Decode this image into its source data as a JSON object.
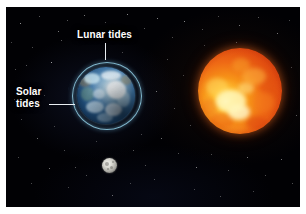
{
  "figure": {
    "background_color": "#010104",
    "frame_color": "#ffffff"
  },
  "labels": {
    "lunar_tides": "Lunar tides",
    "solar_tides": "Solar tides",
    "label_color": "#ffffff",
    "leader_color": "#e9eef2"
  },
  "bodies": {
    "earth": {
      "name": "Earth",
      "tidal_envelope_color": "#8ec8e4",
      "ocean_color": "#2f6ea0",
      "cloud_color": "#f2f6f8"
    },
    "sun": {
      "name": "Sun",
      "core_color": "#ffe066",
      "surface_color": "#ef6a15",
      "limb_color": "#9d2207"
    },
    "moon": {
      "name": "Moon",
      "surface_color": "#d9d8d2"
    }
  },
  "starfield": {
    "star_color": "#ffffff",
    "stars": [
      {
        "x": 14,
        "y": 16,
        "s": 1.1,
        "o": 0.75
      },
      {
        "x": 33,
        "y": 9,
        "s": 0.9,
        "o": 0.55
      },
      {
        "x": 52,
        "y": 24,
        "s": 1.0,
        "o": 0.62
      },
      {
        "x": 26,
        "y": 40,
        "s": 0.8,
        "o": 0.45
      },
      {
        "x": 45,
        "y": 55,
        "s": 1.2,
        "o": 0.8
      },
      {
        "x": 9,
        "y": 62,
        "s": 0.9,
        "o": 0.5
      },
      {
        "x": 61,
        "y": 13,
        "s": 0.8,
        "o": 0.5
      },
      {
        "x": 78,
        "y": 8,
        "s": 1.0,
        "o": 0.6
      },
      {
        "x": 99,
        "y": 15,
        "s": 0.8,
        "o": 0.45
      },
      {
        "x": 121,
        "y": 7,
        "s": 1.1,
        "o": 0.7
      },
      {
        "x": 138,
        "y": 21,
        "s": 0.9,
        "o": 0.55
      },
      {
        "x": 151,
        "y": 11,
        "s": 1.0,
        "o": 0.65
      },
      {
        "x": 166,
        "y": 30,
        "s": 0.8,
        "o": 0.45
      },
      {
        "x": 178,
        "y": 14,
        "s": 1.1,
        "o": 0.7
      },
      {
        "x": 196,
        "y": 22,
        "s": 0.9,
        "o": 0.5
      },
      {
        "x": 212,
        "y": 9,
        "s": 0.8,
        "o": 0.45
      },
      {
        "x": 233,
        "y": 18,
        "s": 1.0,
        "o": 0.6
      },
      {
        "x": 252,
        "y": 10,
        "s": 0.9,
        "o": 0.55
      },
      {
        "x": 271,
        "y": 26,
        "s": 1.0,
        "o": 0.6
      },
      {
        "x": 283,
        "y": 13,
        "s": 0.8,
        "o": 0.45
      },
      {
        "x": 161,
        "y": 52,
        "s": 0.9,
        "o": 0.5
      },
      {
        "x": 177,
        "y": 68,
        "s": 0.8,
        "o": 0.42
      },
      {
        "x": 150,
        "y": 84,
        "s": 1.0,
        "o": 0.6
      },
      {
        "x": 168,
        "y": 101,
        "s": 0.9,
        "o": 0.5
      },
      {
        "x": 184,
        "y": 118,
        "s": 0.8,
        "o": 0.45
      },
      {
        "x": 155,
        "y": 131,
        "s": 1.0,
        "o": 0.58
      },
      {
        "x": 172,
        "y": 146,
        "s": 0.9,
        "o": 0.5
      },
      {
        "x": 190,
        "y": 160,
        "s": 1.1,
        "o": 0.66
      },
      {
        "x": 205,
        "y": 147,
        "s": 0.8,
        "o": 0.45
      },
      {
        "x": 222,
        "y": 163,
        "s": 0.9,
        "o": 0.5
      },
      {
        "x": 241,
        "y": 150,
        "s": 1.0,
        "o": 0.6
      },
      {
        "x": 259,
        "y": 168,
        "s": 0.8,
        "o": 0.45
      },
      {
        "x": 275,
        "y": 152,
        "s": 1.0,
        "o": 0.58
      },
      {
        "x": 286,
        "y": 176,
        "s": 0.9,
        "o": 0.5
      },
      {
        "x": 247,
        "y": 184,
        "s": 0.8,
        "o": 0.42
      },
      {
        "x": 214,
        "y": 189,
        "s": 0.9,
        "o": 0.5
      },
      {
        "x": 188,
        "y": 182,
        "s": 0.8,
        "o": 0.44
      },
      {
        "x": 139,
        "y": 158,
        "s": 0.9,
        "o": 0.5
      },
      {
        "x": 124,
        "y": 176,
        "s": 0.8,
        "o": 0.42
      },
      {
        "x": 106,
        "y": 188,
        "s": 1.0,
        "o": 0.56
      },
      {
        "x": 80,
        "y": 168,
        "s": 0.9,
        "o": 0.5
      },
      {
        "x": 62,
        "y": 180,
        "s": 0.8,
        "o": 0.42
      },
      {
        "x": 43,
        "y": 161,
        "s": 1.0,
        "o": 0.58
      },
      {
        "x": 25,
        "y": 176,
        "s": 0.9,
        "o": 0.48
      },
      {
        "x": 12,
        "y": 150,
        "s": 0.8,
        "o": 0.44
      },
      {
        "x": 31,
        "y": 131,
        "s": 1.0,
        "o": 0.56
      },
      {
        "x": 15,
        "y": 112,
        "s": 0.9,
        "o": 0.48
      },
      {
        "x": 48,
        "y": 119,
        "s": 0.8,
        "o": 0.42
      },
      {
        "x": 8,
        "y": 92,
        "s": 0.9,
        "o": 0.45
      },
      {
        "x": 38,
        "y": 88,
        "s": 0.8,
        "o": 0.4
      },
      {
        "x": 58,
        "y": 143,
        "s": 0.9,
        "o": 0.48
      },
      {
        "x": 135,
        "y": 127,
        "s": 0.8,
        "o": 0.42
      },
      {
        "x": 148,
        "y": 172,
        "s": 0.9,
        "o": 0.5
      },
      {
        "x": 90,
        "y": 134,
        "s": 0.8,
        "o": 0.4
      },
      {
        "x": 198,
        "y": 38,
        "s": 0.8,
        "o": 0.4
      },
      {
        "x": 230,
        "y": 35,
        "s": 0.7,
        "o": 0.38
      },
      {
        "x": 116,
        "y": 45,
        "s": 0.8,
        "o": 0.42
      },
      {
        "x": 55,
        "y": 33,
        "s": 0.7,
        "o": 0.38
      },
      {
        "x": 5,
        "y": 35,
        "s": 0.8,
        "o": 0.42
      },
      {
        "x": 285,
        "y": 60,
        "s": 0.8,
        "o": 0.42
      },
      {
        "x": 290,
        "y": 108,
        "s": 0.7,
        "o": 0.38
      },
      {
        "x": 69,
        "y": 160,
        "s": 0.7,
        "o": 0.36
      },
      {
        "x": 127,
        "y": 143,
        "s": 0.7,
        "o": 0.36
      },
      {
        "x": 20,
        "y": 58,
        "s": 0.7,
        "o": 0.36
      }
    ]
  },
  "earth_features": [
    {
      "x": 7,
      "y": 6,
      "w": 16,
      "h": 11,
      "color": "rgba(200,228,238,0.78)"
    },
    {
      "x": 24,
      "y": 4,
      "w": 20,
      "h": 9,
      "color": "rgba(236,243,247,0.72)"
    },
    {
      "x": 30,
      "y": 14,
      "w": 19,
      "h": 18,
      "color": "rgba(246,249,251,0.85)"
    },
    {
      "x": 16,
      "y": 22,
      "w": 12,
      "h": 10,
      "color": "rgba(230,240,246,0.55)"
    },
    {
      "x": 4,
      "y": 20,
      "w": 13,
      "h": 14,
      "color": "rgba(120,160,120,0.40)"
    },
    {
      "x": 9,
      "y": 34,
      "w": 18,
      "h": 12,
      "color": "rgba(220,235,242,0.60)"
    },
    {
      "x": 28,
      "y": 36,
      "w": 17,
      "h": 13,
      "color": "rgba(238,246,250,0.66)"
    },
    {
      "x": 40,
      "y": 24,
      "w": 13,
      "h": 16,
      "color": "rgba(205,230,240,0.50)"
    },
    {
      "x": 2,
      "y": 10,
      "w": 12,
      "h": 10,
      "color": "rgba(150,120,70,0.45)"
    },
    {
      "x": 44,
      "y": 8,
      "w": 11,
      "h": 10,
      "color": "rgba(170,135,75,0.40)"
    },
    {
      "x": 20,
      "y": 46,
      "w": 16,
      "h": 9,
      "color": "rgba(190,215,228,0.45)"
    }
  ],
  "sun_blobs": [
    {
      "x": 18,
      "y": 42,
      "w": 30,
      "h": 22,
      "color": "rgba(255,246,186,0.85)"
    },
    {
      "x": 30,
      "y": 56,
      "w": 22,
      "h": 16,
      "color": "rgba(255,255,222,0.75)"
    },
    {
      "x": 8,
      "y": 30,
      "w": 22,
      "h": 18,
      "color": "rgba(255,214,92,0.60)"
    },
    {
      "x": 44,
      "y": 20,
      "w": 24,
      "h": 17,
      "color": "rgba(255,196,70,0.45)"
    },
    {
      "x": 56,
      "y": 44,
      "w": 20,
      "h": 20,
      "color": "rgba(242,120,28,0.55)"
    },
    {
      "x": 34,
      "y": 10,
      "w": 18,
      "h": 14,
      "color": "rgba(248,160,40,0.50)"
    },
    {
      "x": 12,
      "y": 64,
      "w": 24,
      "h": 16,
      "color": "rgba(236,96,20,0.50)"
    },
    {
      "x": 48,
      "y": 68,
      "w": 22,
      "h": 14,
      "color": "rgba(220,70,14,0.55)"
    },
    {
      "x": 62,
      "y": 28,
      "w": 16,
      "h": 20,
      "color": "rgba(226,80,16,0.50)"
    },
    {
      "x": 26,
      "y": 74,
      "w": 20,
      "h": 12,
      "color": "rgba(244,132,30,0.45)"
    },
    {
      "x": 4,
      "y": 50,
      "w": 16,
      "h": 18,
      "color": "rgba(238,110,24,0.45)"
    },
    {
      "x": 40,
      "y": 34,
      "w": 16,
      "h": 12,
      "color": "rgba(255,232,140,0.55)"
    }
  ],
  "moon_craters": [
    {
      "x": 3,
      "y": 4,
      "w": 4,
      "h": 4
    },
    {
      "x": 8,
      "y": 8,
      "w": 3,
      "h": 3
    },
    {
      "x": 5,
      "y": 10,
      "w": 2,
      "h": 2
    },
    {
      "x": 10,
      "y": 3,
      "w": 2,
      "h": 2
    }
  ]
}
